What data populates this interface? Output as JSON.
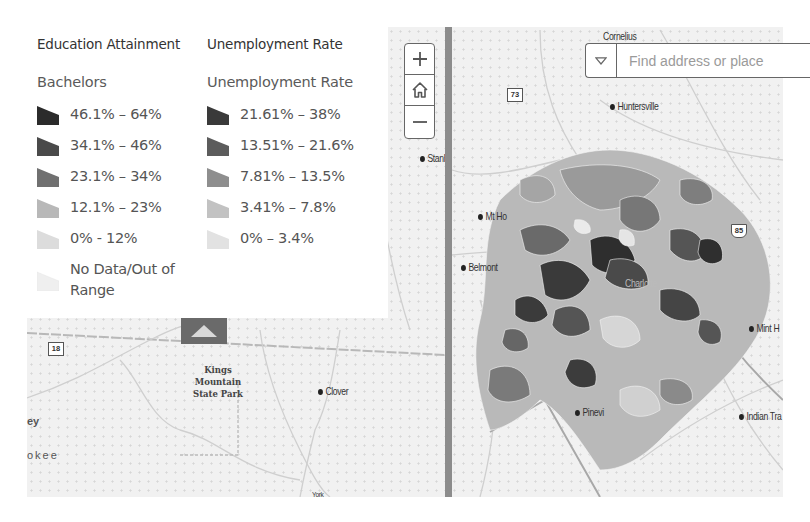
{
  "legend": {
    "education": {
      "title": "Education Attainment",
      "subtitle": "Bachelors",
      "items": [
        {
          "label": "46.1% – 64%",
          "color": "#2b2b2b"
        },
        {
          "label": "34.1% – 46%",
          "color": "#4a4a4a"
        },
        {
          "label": "23.1% – 34%",
          "color": "#707070"
        },
        {
          "label": "12.1% – 23%",
          "color": "#b8b8b8"
        },
        {
          "label": "0% - 12%",
          "color": "#dcdcdc"
        },
        {
          "label": "No Data/Out of Range",
          "color": "#efefef"
        }
      ]
    },
    "unemployment": {
      "title": "Unemployment Rate",
      "subtitle": "Unemployment Rate",
      "items": [
        {
          "label": "21.61% – 38%",
          "color": "#3a3a3a"
        },
        {
          "label": "13.51% – 21.6%",
          "color": "#5c5c5c"
        },
        {
          "label": "7.81% – 13.5%",
          "color": "#8e8e8e"
        },
        {
          "label": "3.41% – 7.8%",
          "color": "#c2c2c2"
        },
        {
          "label": "0% – 3.4%",
          "color": "#e2e2e2"
        }
      ]
    },
    "collapse_icon": "triangle-up"
  },
  "zoom_controls": {
    "zoom_in": "+",
    "home": "home-icon",
    "zoom_out": "−"
  },
  "search": {
    "placeholder": "Find address or place",
    "dropdown_icon": "triangle-down"
  },
  "map": {
    "left_places": {
      "stanley": "Stanle",
      "clover": "Clover",
      "park": "Kings Mountain State Park",
      "park_lines": [
        "Kings",
        "Mountain",
        "State Park"
      ],
      "route_18": "18",
      "edge_ey": "ey",
      "edge_okee": "okee",
      "york": "York"
    },
    "right_places": {
      "cornelius": "Cornelius",
      "huntersville": "Huntersville",
      "mt_holly": "Mt Ho",
      "belmont": "Belmont",
      "mint_hill": "Mint H",
      "indian_trail": "Indian Tra",
      "pineville": "Pinevi",
      "charlotte": "Charlotte",
      "route_73": "73",
      "route_85": "85"
    }
  },
  "colors": {
    "divider": "#8c8c8c",
    "collapse_button": "#6a6a6a",
    "map_background": "#f1f1f1"
  }
}
